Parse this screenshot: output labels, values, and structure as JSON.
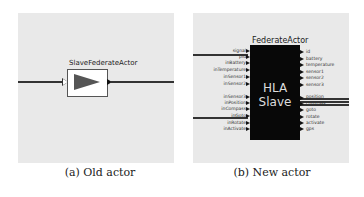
{
  "panels": [
    {
      "id": "a",
      "caption": "(a) Old actor",
      "actor": {
        "title": "SlaveFederateActor",
        "icon": "play-triangle-icon",
        "fill_color": "#555555"
      }
    },
    {
      "id": "b",
      "caption": "(b) New actor",
      "actor": {
        "title": "FederateActor",
        "body_text_line1": "HLA",
        "body_text_line2": "Slave",
        "fill_color": "#080808",
        "inputs_top": [
          "signal",
          "pid",
          "inBattery",
          "inTemperature",
          "inSensor1",
          "inSensor2"
        ],
        "inputs_bottom": [
          "inSensor3",
          "inPosition",
          "inCompass",
          "inGoto",
          "inRotate",
          "inActivate"
        ],
        "outputs_top": [
          "id",
          "battery",
          "temperature",
          "sensor1",
          "sensor2",
          "sensor3"
        ],
        "outputs_bottom": [
          "position",
          "compass",
          "goto",
          "rotate",
          "activate",
          "gps"
        ]
      }
    }
  ],
  "colors": {
    "panel_bg": "#e9e9e9",
    "wire": "#333333"
  }
}
